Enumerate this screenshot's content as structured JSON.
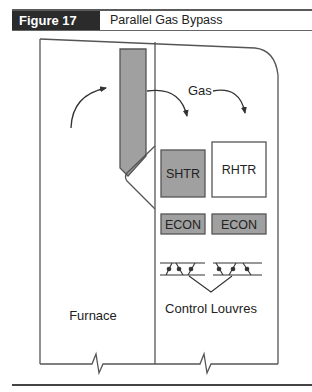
{
  "header": {
    "figure_label": "Figure 17",
    "figure_title": "Parallel Gas Bypass"
  },
  "diagram": {
    "labels": {
      "gas": "Gas",
      "furnace": "Furnace",
      "control_louvres": "Control Louvres"
    },
    "components": [
      {
        "id": "shtr",
        "label": "SHTR",
        "fill": "#a0a0a0"
      },
      {
        "id": "rhtr",
        "label": "RHTR",
        "fill": "#ffffff"
      },
      {
        "id": "econ-left",
        "label": "ECON",
        "fill": "#a0a0a0"
      },
      {
        "id": "econ-right",
        "label": "ECON",
        "fill": "#a0a0a0"
      }
    ],
    "colors": {
      "stroke": "#555555",
      "component_fill": "#a0a0a0",
      "header_bg": "#2b2b2b"
    }
  }
}
